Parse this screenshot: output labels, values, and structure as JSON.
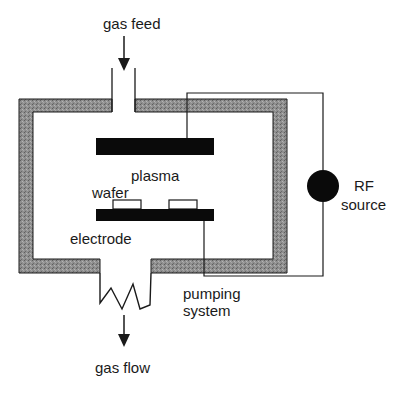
{
  "diagram": {
    "labels": {
      "gas_feed": "gas feed",
      "plasma": "plasma",
      "wafer": "wafer",
      "electrode": "electrode",
      "rf_line1": "RF",
      "rf_line2": "source",
      "pumping_line1": "pumping",
      "pumping_line2": "system",
      "gas_flow": "gas flow"
    },
    "colors": {
      "wall_fill": "#8a8a8a",
      "electrode": "#0a0a0a",
      "line": "#1a1a1a",
      "background": "#ffffff"
    }
  }
}
